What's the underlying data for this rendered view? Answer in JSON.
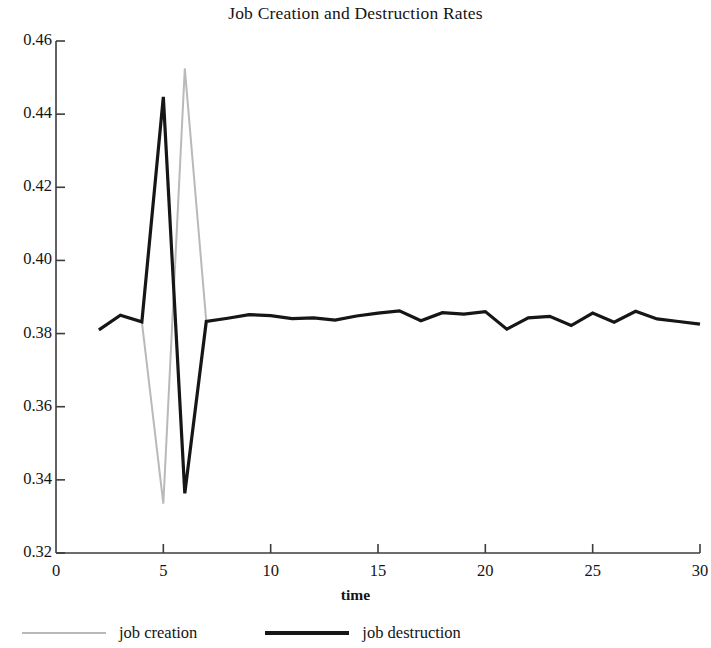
{
  "chart_data": {
    "type": "line",
    "title": "Job Creation and Destruction Rates",
    "xlabel": "time",
    "ylabel": "",
    "xlim": [
      0,
      30
    ],
    "ylim": [
      0.32,
      0.46
    ],
    "grid": false,
    "legend_position": "bottom-left",
    "x_ticks": [
      0,
      5,
      10,
      15,
      20,
      25,
      30
    ],
    "x_tick_labels": [
      "0",
      "5",
      "10",
      "15",
      "20",
      "25",
      "30"
    ],
    "y_ticks": [
      0.32,
      0.34,
      0.36,
      0.38,
      0.4,
      0.42,
      0.44,
      0.46
    ],
    "y_tick_labels": [
      "0.32",
      "0.34",
      "0.36",
      "0.38",
      "0.40",
      "0.42",
      "0.44",
      "0.46"
    ],
    "x": [
      2,
      3,
      4,
      5,
      6,
      7,
      8,
      9,
      10,
      11,
      12,
      13,
      14,
      15,
      16,
      17,
      18,
      19,
      20,
      21,
      22,
      23,
      24,
      25,
      26,
      27,
      28,
      29,
      30
    ],
    "series": [
      {
        "name": "job creation",
        "color": "#b9b9b9",
        "line_width": 2,
        "values": [
          0.381,
          0.385,
          0.3832,
          0.3335,
          0.4525,
          0.3833,
          0.3842,
          0.3852,
          0.3849,
          0.3841,
          0.3843,
          0.3837,
          0.3848,
          0.3856,
          0.3862,
          0.3835,
          0.3857,
          0.3853,
          0.386,
          0.3812,
          0.3843,
          0.3847,
          0.3822,
          0.3856,
          0.3831,
          0.3861,
          0.384,
          0.3833,
          0.3826
        ]
      },
      {
        "name": "job destruction",
        "color": "#161616",
        "line_width": 3.2,
        "values": [
          0.381,
          0.385,
          0.3832,
          0.4447,
          0.3363,
          0.3833,
          0.3842,
          0.3852,
          0.3849,
          0.3841,
          0.3843,
          0.3837,
          0.3848,
          0.3856,
          0.3862,
          0.3835,
          0.3857,
          0.3853,
          0.386,
          0.3812,
          0.3843,
          0.3847,
          0.3822,
          0.3856,
          0.3831,
          0.3861,
          0.384,
          0.3833,
          0.3826
        ]
      }
    ]
  },
  "legend": {
    "creation_label": "job creation",
    "destruction_label": "job destruction"
  },
  "axes": {
    "axis_color": "#3c3c3c"
  }
}
